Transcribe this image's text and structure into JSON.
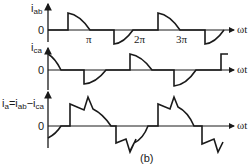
{
  "figure": {
    "caption": "(b)",
    "x_axis_label": "ωt",
    "zero_label": "0",
    "tick_labels": [
      "π",
      "2π",
      "3π"
    ],
    "stroke_color": "#1a1a1a"
  },
  "panels": [
    {
      "id": "iab",
      "label_main": "i",
      "label_sub": "ab",
      "description": "Line current i_ab: positive half-cycle arcs after conduction delay, negative half-cycle arcs"
    },
    {
      "id": "ica",
      "label_main": "i",
      "label_sub": "ca",
      "description": "Line current i_ca: same shape as i_ab shifted in phase"
    },
    {
      "id": "ia",
      "label_parts": [
        "i",
        "a",
        "=i",
        "ab",
        "−i",
        "ca"
      ],
      "description": "Phase current i_a = i_ab − i_ca with jagged stepped waveform"
    }
  ]
}
